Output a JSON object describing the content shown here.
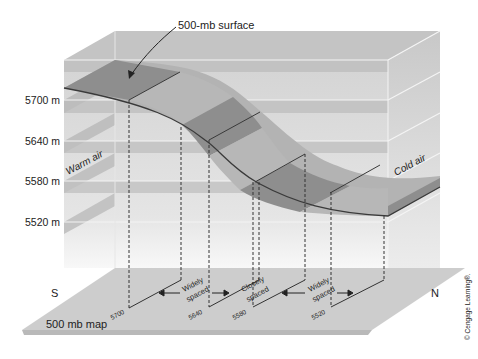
{
  "title_callout": "500-mb surface",
  "height_labels": [
    "5700 m",
    "5640 m",
    "5580 m",
    "5520 m"
  ],
  "air_labels": {
    "warm": "Warm air",
    "cold": "Cold air"
  },
  "direction_labels": {
    "south": "S",
    "north": "N"
  },
  "map_label": "500 mb map",
  "contour_labels": [
    "5700",
    "5640",
    "5580",
    "5520"
  ],
  "spacing_labels": [
    {
      "line1": "Widely",
      "line2": "spaced"
    },
    {
      "line1": "Closely",
      "line2": "spaced"
    },
    {
      "line1": "Widely",
      "line2": "spaced"
    }
  ],
  "copyright": "© Cengage Learning®.",
  "colors": {
    "surface_dark": "#8f8f8f",
    "surface_light": "#b5b5b5",
    "box_fill": "#d6d6d6",
    "floor": "#cfcfcf",
    "band_line": "#f2f2f2"
  }
}
